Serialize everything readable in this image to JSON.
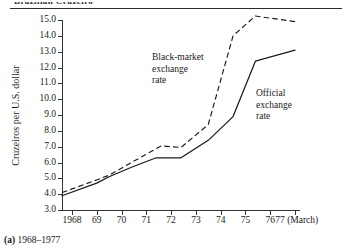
{
  "page": {
    "running_head": "Brazilian Cruzeiro",
    "caption_marker": "(a)",
    "caption_text": "1968–1977"
  },
  "chart_data": {
    "type": "line",
    "title": "",
    "xlabel": "",
    "ylabel": "Cruzeiros per U.S. dollar",
    "ylim": [
      3.0,
      15.0
    ],
    "ytick_step": 1.0,
    "yticks": [
      "15.0",
      "14.0",
      "13.0",
      "12.0",
      "11.0",
      "10.0",
      "9.0",
      "8.0",
      "7.0",
      "6.0",
      "5.0",
      "4.0",
      "3.0"
    ],
    "ytick_values": [
      15.0,
      14.0,
      13.0,
      12.0,
      11.0,
      10.0,
      9.0,
      8.0,
      7.0,
      6.0,
      5.0,
      4.0,
      3.0
    ],
    "xticks": [
      "1968",
      "69",
      "70",
      "71",
      "72",
      "73",
      "74",
      "75",
      "76",
      "77"
    ],
    "xtick_values": [
      1968,
      1969,
      1970,
      1971,
      1972,
      1973,
      1974,
      1975,
      1976,
      1977
    ],
    "xlim": [
      1967.6,
      1977.2
    ],
    "x_axis_suffix": "(March)",
    "grid": false,
    "legend": "annotations",
    "series": [
      {
        "name": "Black-market exchange rate",
        "style": "dashed",
        "color": "#1a1a1a",
        "x": [
          1967.6,
          1969.0,
          1969.5,
          1970.4,
          1971.6,
          1972.4,
          1973.5,
          1974.5,
          1975.4,
          1977.0
        ],
        "values": [
          4.1,
          4.9,
          5.2,
          6.0,
          7.05,
          6.95,
          8.4,
          14.0,
          15.25,
          14.9
        ]
      },
      {
        "name": "Official exchange rate",
        "style": "solid",
        "color": "#1a1a1a",
        "x": [
          1967.6,
          1969.0,
          1969.5,
          1970.4,
          1971.4,
          1972.4,
          1973.5,
          1974.5,
          1975.4,
          1977.0
        ],
        "values": [
          3.9,
          4.7,
          5.1,
          5.7,
          6.3,
          6.3,
          7.4,
          8.9,
          12.4,
          13.1
        ]
      }
    ],
    "annotations": [
      {
        "id": "black-market",
        "lines": [
          "Black-market",
          "exchange",
          "rate"
        ]
      },
      {
        "id": "official",
        "lines": [
          "Official",
          "exchange",
          "rate"
        ]
      }
    ]
  }
}
